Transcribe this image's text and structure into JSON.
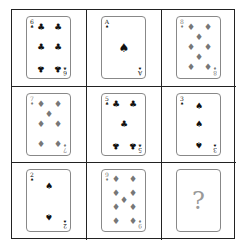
{
  "puzzle": {
    "title": "",
    "grid": [
      {
        "rank": "6",
        "suit": "clubs",
        "suit_glyph": "♣",
        "color": "black"
      },
      {
        "rank": "A",
        "suit": "spades",
        "suit_glyph": "♠",
        "color": "black"
      },
      {
        "rank": "8",
        "suit": "diamonds",
        "suit_glyph": "♦",
        "color": "red"
      },
      {
        "rank": "7",
        "suit": "diamonds",
        "suit_glyph": "♦",
        "color": "red"
      },
      {
        "rank": "5",
        "suit": "clubs",
        "suit_glyph": "♣",
        "color": "black"
      },
      {
        "rank": "3",
        "suit": "spades",
        "suit_glyph": "♠",
        "color": "black"
      },
      {
        "rank": "2",
        "suit": "spades",
        "suit_glyph": "♠",
        "color": "black"
      },
      {
        "rank": "9",
        "suit": "diamonds",
        "suit_glyph": "♦",
        "color": "red"
      },
      {
        "rank": "?",
        "suit": "unknown",
        "suit_glyph": "",
        "color": "gray",
        "is_missing": true
      }
    ],
    "missing_label": "?"
  },
  "colors": {
    "grid_line": "#222222",
    "card_border": "#888888",
    "black_suit": "#111111",
    "red_suit_rendered": "#777777",
    "question_mark": "#999999"
  }
}
